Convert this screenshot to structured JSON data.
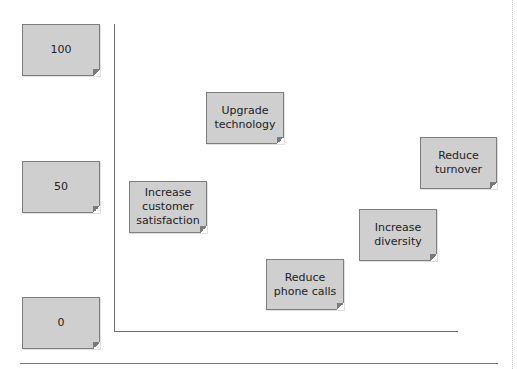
{
  "diagram": {
    "y_axis_labels": [
      {
        "id": "label-100",
        "text": "100"
      },
      {
        "id": "label-50",
        "text": "50"
      },
      {
        "id": "label-0",
        "text": "0"
      }
    ],
    "notes": [
      {
        "id": "upgrade-technology",
        "text": "Upgrade technology"
      },
      {
        "id": "reduce-turnover",
        "text": "Reduce turnover"
      },
      {
        "id": "increase-customer-satisfaction",
        "text": "Increase customer satisfaction"
      },
      {
        "id": "increase-diversity",
        "text": "Increase diversity"
      },
      {
        "id": "reduce-phone-calls",
        "text": "Reduce phone calls"
      }
    ],
    "colors": {
      "note_fill": "#cfcfcf",
      "note_border": "#7d7d7d",
      "axis": "#6e6e6e"
    }
  }
}
